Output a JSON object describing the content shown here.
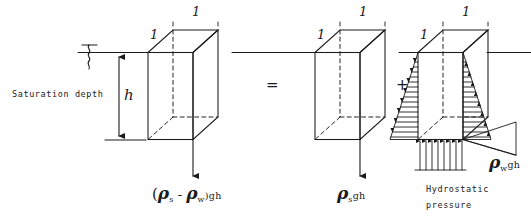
{
  "figure": {
    "type": "engineering-free-body-diagram",
    "background_color": "#ffffff",
    "ink_color": "#1a1a1a"
  },
  "annotations": {
    "saturation_depth_label": "Saturation depth",
    "depth_dimension_label": "h",
    "water_table_symbol": "water-table-squiggle",
    "hydrostatic_pressure_label_line1": "Hydrostatic",
    "hydrostatic_pressure_label_line2": "pressure"
  },
  "operators": {
    "equals": "=",
    "plus": "+"
  },
  "elements": [
    {
      "id": "left-cube",
      "name": "effective-stress-cube",
      "top_edge_label": "1",
      "side_edge_label": "1",
      "force_direction": "down",
      "formula": {
        "open_paren": "(",
        "rho_1": "ρ",
        "sub_1": "s",
        "minus": "-",
        "rho_2": "ρ",
        "sub_2": "w",
        "close_paren": ")",
        "suffix": "gh",
        "plain": "(ρs - ρw)gh"
      }
    },
    {
      "id": "middle-cube",
      "name": "total-stress-cube",
      "top_edge_label": "1",
      "side_edge_label": "1",
      "force_direction": "down",
      "formula": {
        "rho_1": "ρ",
        "sub_1": "s",
        "suffix": "gh",
        "plain": "ρs gh"
      }
    },
    {
      "id": "right-cube",
      "name": "hydrostatic-pressure-cube",
      "top_edge_label": "1",
      "side_edge_label": "1",
      "force_direction": "lateral-and-uplift",
      "formula": {
        "rho_1": "ρ",
        "sub_1": "w",
        "suffix": "gh",
        "plain": "ρw gh"
      }
    }
  ]
}
